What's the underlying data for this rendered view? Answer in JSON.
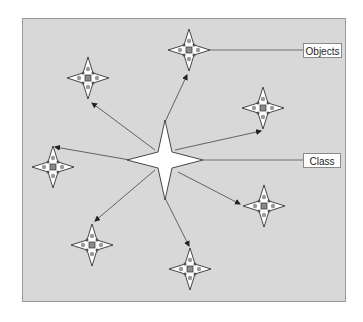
{
  "diagram": {
    "title": "",
    "labels": {
      "objects": "Objects",
      "class": "Class"
    },
    "colors": {
      "background": "#d8d8d8",
      "frame_border": "#9a9a9a",
      "star_fill": "#ffffff",
      "star_stroke": "#333333",
      "arrow": "#444444",
      "dot": "#9a9a9a",
      "center_square": "#8a8a8a"
    },
    "class_node": {
      "name": "class-star",
      "cx": 165,
      "cy": 160,
      "rx": 38,
      "ry": 40
    },
    "object_nodes": [
      {
        "name": "object-star-top",
        "cx": 189,
        "cy": 50,
        "arrow_tip": [
          187,
          75
        ]
      },
      {
        "name": "object-star-upper-left",
        "cx": 88,
        "cy": 78,
        "arrow_tip": [
          92,
          103
        ]
      },
      {
        "name": "object-star-upper-right",
        "cx": 263,
        "cy": 108,
        "arrow_tip": [
          261,
          131
        ]
      },
      {
        "name": "object-star-left",
        "cx": 53,
        "cy": 167,
        "arrow_tip": [
          55,
          147
        ]
      },
      {
        "name": "object-star-lower-right",
        "cx": 264,
        "cy": 206,
        "arrow_tip": [
          240,
          204
        ]
      },
      {
        "name": "object-star-lower-left",
        "cx": 92,
        "cy": 245,
        "arrow_tip": [
          95,
          221
        ]
      },
      {
        "name": "object-star-bottom",
        "cx": 190,
        "cy": 269,
        "arrow_tip": [
          189,
          246
        ]
      }
    ]
  }
}
